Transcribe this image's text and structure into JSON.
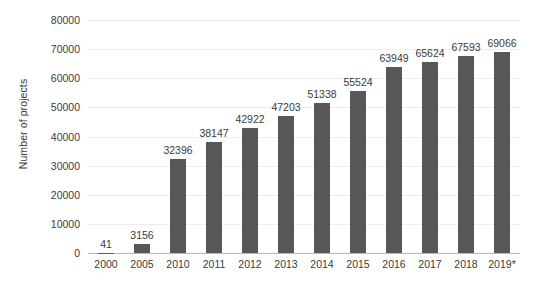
{
  "chart_data": {
    "type": "bar",
    "title": "",
    "subtitle": "",
    "xlabel": "",
    "ylabel": "Number of projects",
    "categories": [
      "2000",
      "2005",
      "2010",
      "2011",
      "2012",
      "2013",
      "2014",
      "2015",
      "2016",
      "2017",
      "2018",
      "2019*"
    ],
    "values": [
      41,
      3156,
      32396,
      38147,
      42922,
      47203,
      51338,
      55524,
      63949,
      65624,
      67593,
      69066
    ],
    "data_labels": [
      "41",
      "3156",
      "32396",
      "38147",
      "42922",
      "47203",
      "51338",
      "55524",
      "63949",
      "65624",
      "67593",
      "69066"
    ],
    "ylim": [
      0,
      80000
    ],
    "y_ticks": [
      0,
      10000,
      20000,
      30000,
      40000,
      50000,
      60000,
      70000,
      80000
    ],
    "y_tick_labels": [
      "0",
      "10000",
      "20000",
      "30000",
      "40000",
      "50000",
      "60000",
      "70000",
      "80000"
    ],
    "grid": true,
    "grid_axis": "y",
    "legend": false,
    "legend_position": "none",
    "series": [
      {
        "name": "Number of projects",
        "values": [
          41,
          3156,
          32396,
          38147,
          42922,
          47203,
          51338,
          55524,
          63949,
          65624,
          67593,
          69066
        ]
      }
    ]
  },
  "colors": {
    "bar": "#58585a",
    "grid": "#ededef",
    "axis": "#b9b9bc",
    "text": "#3b3b3b",
    "background": "#ffffff"
  }
}
